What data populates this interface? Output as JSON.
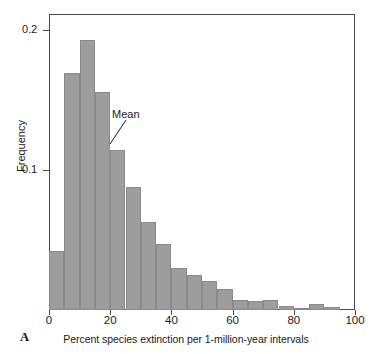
{
  "figure": {
    "panel_label": "A",
    "annotation": {
      "text": "Mean"
    }
  },
  "chart_data": {
    "type": "bar",
    "title": "",
    "subtitle": "",
    "xlabel": "Percent species extinction per 1-million-year intervals",
    "ylabel": "Frequency",
    "bin_width": 5,
    "categories": [
      "0-5",
      "5-10",
      "10-15",
      "15-20",
      "20-25",
      "25-30",
      "30-35",
      "35-40",
      "40-45",
      "45-50",
      "50-55",
      "55-60",
      "60-65",
      "65-70",
      "70-75",
      "75-80",
      "80-85",
      "85-90",
      "90-95"
    ],
    "x": [
      0,
      5,
      10,
      15,
      20,
      25,
      30,
      35,
      40,
      45,
      50,
      55,
      60,
      65,
      70,
      75,
      80,
      85,
      90
    ],
    "values": [
      0.042,
      0.169,
      0.193,
      0.156,
      0.114,
      0.088,
      0.063,
      0.047,
      0.03,
      0.025,
      0.021,
      0.015,
      0.0075,
      0.0065,
      0.0075,
      0.003,
      0.0015,
      0.004,
      0.002
    ],
    "xlim": [
      0,
      100
    ],
    "ylim": [
      0,
      0.2114
    ],
    "xticks": [
      0,
      20,
      40,
      60,
      80,
      100
    ],
    "xtick_labels": [
      "0",
      "20",
      "40",
      "60",
      "80",
      "100"
    ],
    "yticks": [
      0.1,
      0.2
    ],
    "ytick_labels": [
      "0.1",
      "0.2"
    ],
    "grid": true,
    "grid_axis": "y",
    "legend": false,
    "annotations": [
      {
        "text": "Mean",
        "points_to_x": 22.5,
        "points_to_y": 0.114
      }
    ],
    "colors": {
      "bar_fill": "#9d9d9d",
      "bar_edge": "#8a8a8a",
      "axis": "#4a4a4a",
      "grid": "#b9b9b9",
      "text": "#1a1a1a"
    }
  }
}
